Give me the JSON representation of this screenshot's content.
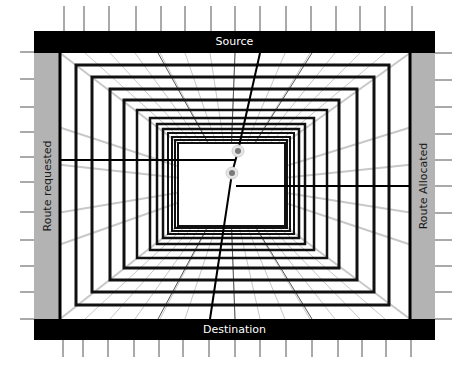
{
  "diagram": {
    "labels": {
      "top": "Source",
      "bottom": "Destination",
      "left": "Route requested",
      "right": "Route Allocated"
    },
    "colors": {
      "frame": "#000000",
      "side_panel": "#b3b3b3",
      "grid_line": "#c8c8c8",
      "rect_line": "#111111",
      "route_line": "#000000",
      "dot_outer": "#e6e6e6",
      "dot_inner": "#7a7a7a",
      "tick": "#555555"
    },
    "nodes": [
      {
        "name": "node-upper",
        "x": 238,
        "y": 151
      },
      {
        "name": "node-lower",
        "x": 232,
        "y": 173
      }
    ],
    "routes": {
      "requested": {
        "from": [
          60,
          160
        ],
        "to": [
          236,
          160
        ]
      },
      "allocated": {
        "from": [
          236,
          186
        ],
        "to": [
          410,
          186
        ]
      },
      "source_to_destination": {
        "from": [
          260,
          53
        ],
        "via": [
          [
            238,
            151
          ],
          [
            232,
            173
          ]
        ],
        "to": [
          210,
          319
        ]
      }
    },
    "nested_rectangles": [
      {
        "l": 60,
        "t": 53,
        "r": 410,
        "b": 319
      },
      {
        "l": 76,
        "t": 65,
        "r": 389,
        "b": 305
      },
      {
        "l": 92,
        "t": 77,
        "r": 374,
        "b": 292
      },
      {
        "l": 110,
        "t": 89,
        "r": 357,
        "b": 280
      },
      {
        "l": 124,
        "t": 100,
        "r": 339,
        "b": 268
      },
      {
        "l": 137,
        "t": 110,
        "r": 327,
        "b": 258
      },
      {
        "l": 150,
        "t": 118,
        "r": 314,
        "b": 250
      },
      {
        "l": 157,
        "t": 124,
        "r": 305,
        "b": 244
      },
      {
        "l": 163,
        "t": 129,
        "r": 299,
        "b": 238
      },
      {
        "l": 168,
        "t": 133,
        "r": 294,
        "b": 234
      },
      {
        "l": 172,
        "t": 137,
        "r": 290,
        "b": 231
      },
      {
        "l": 175,
        "t": 140,
        "r": 287,
        "b": 228
      },
      {
        "l": 178,
        "t": 143,
        "r": 285,
        "b": 226
      }
    ],
    "ticks": {
      "top_x": [
        64,
        84,
        109,
        136,
        161,
        185,
        211,
        235,
        260,
        286,
        311,
        336,
        360,
        385,
        412
      ],
      "bottom_x": [
        63,
        83,
        108,
        134,
        159,
        183,
        209,
        235,
        260,
        286,
        312,
        338,
        362,
        386,
        411
      ],
      "left_y": [
        52,
        79,
        107,
        132,
        157,
        182,
        212,
        240,
        266,
        292,
        319
      ],
      "right_y": [
        53,
        80,
        107,
        134,
        160,
        186,
        213,
        240,
        266,
        292,
        319
      ]
    }
  }
}
